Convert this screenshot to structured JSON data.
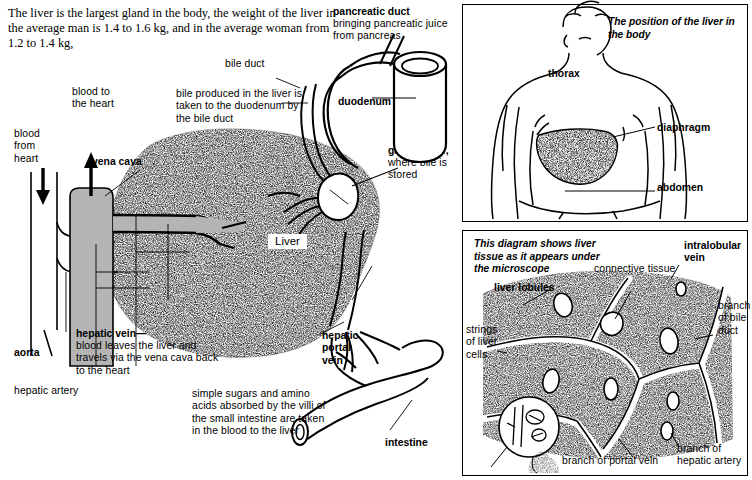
{
  "document": {
    "title": "The liver — structure, position and microscopic tissue",
    "intro_text": "The liver is the largest gland in the body, the weight of the liver in the average man is 1.4 to 1.6 kg, and in the average woman from 1.2 to 1.4 kg,"
  },
  "main_diagram": {
    "organ_label": "Liver",
    "labels": {
      "blood_from_heart": "blood\nfrom\nheart",
      "blood_to_heart": "blood to\nthe heart",
      "vena_cava": "vena cava",
      "aorta": "aorta",
      "hepatic_artery": "hepatic artery",
      "hepatic_vein_title": "hepatic vein—",
      "hepatic_vein_body": "blood leaves the liver and travels via the vena cava back to the heart",
      "bile_note": "bile produced in the liver is taken to the duodenum by the bile duct",
      "bile_duct": "bile duct",
      "pancreatic_duct_title": "pancreatic duct",
      "pancreatic_duct_body": "bringing pancreatic juice from pancreas",
      "duodenum": "duodenum",
      "gall_bladder_title": "gall bladder,",
      "gall_bladder_body": "where bile is stored",
      "hepatic_portal_vein": "hepatic\nportal\nvein",
      "intestine": "intestine",
      "villi_note": "simple sugars and amino acids absorbed by the villi of the small intestine are taken in the blood to the liver"
    }
  },
  "body_panel": {
    "caption": "The position of the liver in the body",
    "labels": {
      "thorax": "thorax",
      "diaphragm": "diaphragm",
      "abdomen": "abdomen"
    }
  },
  "micro_panel": {
    "caption": "This diagram shows liver tissue as it appears under the microscope",
    "labels": {
      "liver_lobules": "liver lobules",
      "strings_of_liver_cells": "strings\nof liver\ncells",
      "connective_tissue": "connective tissue",
      "intralobular_vein": "intralobular\nvein",
      "branch_of_bile_duct": "branch\nof bile\nduct",
      "branch_of_portal_vein": "branch of portal vein",
      "branch_of_hepatic_artery": "branch of\nhepatic artery"
    }
  },
  "colors": {
    "ink": "#000000",
    "paper": "#ffffff",
    "vessel_fill": "#b4b4b4",
    "stipple": "#1a1a1a"
  }
}
